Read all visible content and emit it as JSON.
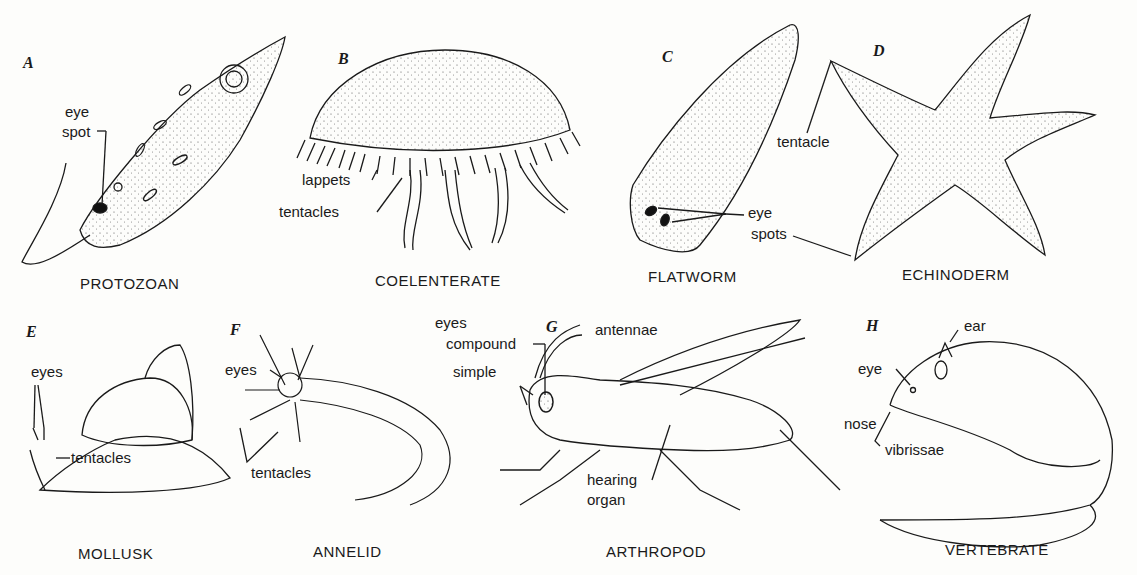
{
  "figure": {
    "panels": [
      {
        "letter": "A",
        "caption": "PROTOZOAN",
        "labels": [
          "eye",
          "spot"
        ]
      },
      {
        "letter": "B",
        "caption": "COELENTERATE",
        "labels": [
          "lappets",
          "tentacles"
        ]
      },
      {
        "letter": "C",
        "caption": "FLATWORM",
        "labels": [
          "eye",
          "spots"
        ]
      },
      {
        "letter": "D",
        "caption": "ECHINODERM",
        "labels": [
          "tentacle"
        ]
      },
      {
        "letter": "E",
        "caption": "MOLLUSK",
        "labels": [
          "eyes",
          "tentacles"
        ]
      },
      {
        "letter": "F",
        "caption": "ANNELID",
        "labels": [
          "eyes",
          "tentacles"
        ]
      },
      {
        "letter": "G",
        "caption": "ARTHROPOD",
        "labels": [
          "eyes",
          "compound",
          "simple",
          "antennae",
          "hearing",
          "organ"
        ]
      },
      {
        "letter": "H",
        "caption": "VERTEBRATE",
        "labels": [
          "ear",
          "eye",
          "nose",
          "vibrissae"
        ]
      }
    ]
  }
}
